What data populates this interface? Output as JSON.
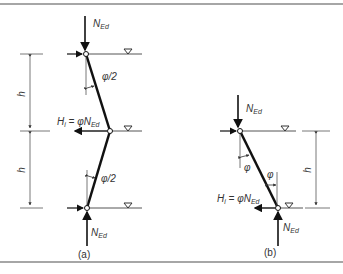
{
  "figure": {
    "panel_a": {
      "caption": "(a)",
      "axial_load_top": "N",
      "axial_load_top_sub": "Ed",
      "axial_load_bottom": "N",
      "axial_load_bottom_sub": "Ed",
      "angle_top": "φ/2",
      "angle_bottom": "φ/2",
      "horizontal_force": "H",
      "horizontal_force_sub": "i",
      "horizontal_force_eq": " = φN",
      "horizontal_force_eq_sub": "Ed",
      "height_top": "h",
      "height_bottom": "h"
    },
    "panel_b": {
      "caption": "(b)",
      "axial_load_top": "N",
      "axial_load_top_sub": "Ed",
      "axial_load_bottom": "N",
      "axial_load_bottom_sub": "Ed",
      "angle_top": "φ",
      "angle_bottom": "φ",
      "horizontal_force": "H",
      "horizontal_force_sub": "i",
      "horizontal_force_eq": " = φN",
      "horizontal_force_eq_sub": "Ed",
      "height": "h"
    }
  },
  "colors": {
    "line": "#111111",
    "thin": "#555555",
    "border": "#888888"
  }
}
